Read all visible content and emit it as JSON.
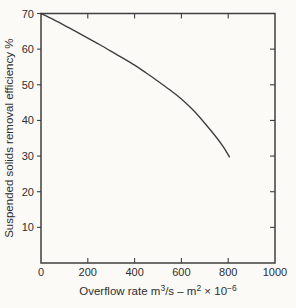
{
  "chart_data": {
    "type": "line",
    "title": "",
    "xlabel": "Overflow rate m³/s – m² × 10⁻⁶",
    "xlabel_parts": [
      {
        "text": "Overflow rate m",
        "sup": false
      },
      {
        "text": "3",
        "sup": true
      },
      {
        "text": "/s – m",
        "sup": false
      },
      {
        "text": "2",
        "sup": true
      },
      {
        "text": " × 10",
        "sup": false
      },
      {
        "text": "−6",
        "sup": true
      }
    ],
    "ylabel": "Suspended solids removal efficiency %",
    "xlim": [
      0,
      1000
    ],
    "ylim": [
      0,
      70
    ],
    "xticks": {
      "values": [
        0,
        200,
        400,
        600,
        800,
        1000
      ],
      "labels": [
        "0",
        "200",
        "400",
        "600",
        "800",
        "1000"
      ]
    },
    "yticks": {
      "values": [
        10,
        20,
        30,
        40,
        50,
        60,
        70
      ],
      "labels": [
        "10",
        "20",
        "30",
        "40",
        "50",
        "60",
        "70"
      ]
    },
    "grid": false,
    "legend": "none",
    "frame": "box",
    "series": [
      {
        "name": "Suspended solids removal efficiency",
        "x": [
          0,
          50,
          100,
          150,
          200,
          250,
          300,
          350,
          400,
          450,
          500,
          550,
          600,
          650,
          700,
          750,
          780,
          805
        ],
        "y": [
          70,
          68.4,
          66.7,
          64.9,
          63.1,
          61.3,
          59.4,
          57.5,
          55.5,
          53.3,
          51.0,
          48.6,
          46.0,
          42.9,
          39.2,
          35.2,
          32.5,
          29.8
        ]
      }
    ],
    "colors": {
      "line": "#3f3f3f",
      "frame": "#3f3f3f",
      "text": "#2e2e2e",
      "background": "#fbfaf7"
    }
  }
}
